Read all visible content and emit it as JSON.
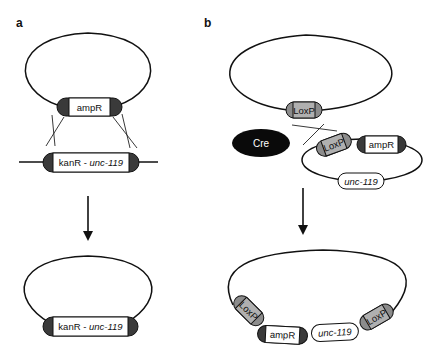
{
  "figure": {
    "panels": [
      {
        "label": "a",
        "top_plasmid": {
          "cassette": "ampR"
        },
        "linear_dna": {
          "cassette_prefix": "kanR - ",
          "cassette_gene": "unc-119"
        },
        "result_plasmid": {
          "cassette_prefix": "kanR - ",
          "cassette_gene": "unc-119"
        }
      },
      {
        "label": "b",
        "top_plasmid": {
          "site": "LoxP"
        },
        "enzyme": "Cre",
        "donor_plasmid": {
          "site": "LoxP",
          "cassette": "ampR",
          "gene": "unc-119"
        },
        "result_plasmid": {
          "site_left": "LoxP",
          "cassette": "ampR",
          "gene": "unc-119",
          "site_right": "LoxP"
        }
      }
    ],
    "colors": {
      "stroke": "#111111",
      "end_cap_dark": "#3a3a3a",
      "loxp_fill": "#8c8c8c",
      "loxp_body": "#b0b0b0",
      "cre_fill": "#0a0a0a",
      "cre_text": "#ffffff",
      "box_fill": "#ffffff"
    }
  }
}
